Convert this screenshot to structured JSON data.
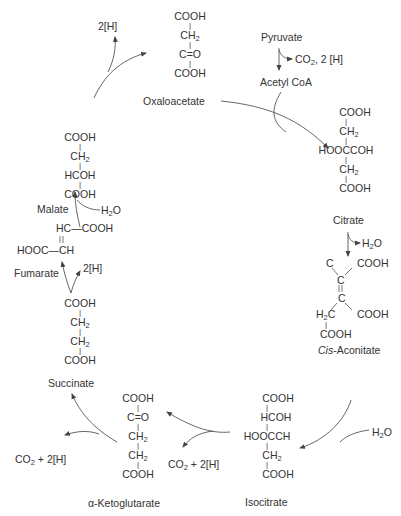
{
  "diagram": {
    "compounds": {
      "oxaloacetate": {
        "name": "Oxaloacetate",
        "lines": [
          "COOH",
          "CH2",
          "C=O",
          "COOH"
        ]
      },
      "pyruvate": {
        "name": "Pyruvate"
      },
      "acetyl_coa": {
        "name": "Acetyl CoA"
      },
      "citrate": {
        "name": "Citrate",
        "lines": [
          "COOH",
          "CH2",
          "HOOCCOH",
          "CH2",
          "COOH"
        ]
      },
      "cis_aconitate": {
        "name_italic": "Cis",
        "name_rest": "-Aconitate",
        "lines": [
          "C",
          "COOH",
          "C",
          "C",
          "H2C",
          "COOH",
          "COOH"
        ]
      },
      "isocitrate": {
        "name": "Isocitrate",
        "lines": [
          "COOH",
          "HCOH",
          "HOOCCH",
          "CH2",
          "COOH"
        ]
      },
      "alpha_ketoglutarate": {
        "name": "α-Ketoglutarate",
        "lines": [
          "COOH",
          "C=O",
          "CH2",
          "CH2",
          "COOH"
        ]
      },
      "succinate": {
        "name": "Succinate",
        "lines": [
          "COOH",
          "CH2",
          "CH2",
          "COOH"
        ]
      },
      "fumarate": {
        "name": "Fumarate",
        "lines": [
          "HC—COOH",
          "HOOC—CH"
        ]
      },
      "malate": {
        "name": "Malate",
        "lines": [
          "COOH",
          "CH2",
          "HCOH",
          "COOH"
        ]
      }
    },
    "byproducts": {
      "pyruvate_out": "CO2, 2 [H]",
      "citrate_out": "H2O",
      "aconitate_in": "H2O",
      "isocitrate_out": "CO2 + 2[H]",
      "ketoglutarate_out": "CO2 + 2[H]",
      "succinate_out": "2[H]",
      "fumarate_in": "H2O",
      "malate_out": "2[H]"
    },
    "colors": {
      "text": "#333333",
      "line": "#444444",
      "background": "#ffffff"
    }
  }
}
